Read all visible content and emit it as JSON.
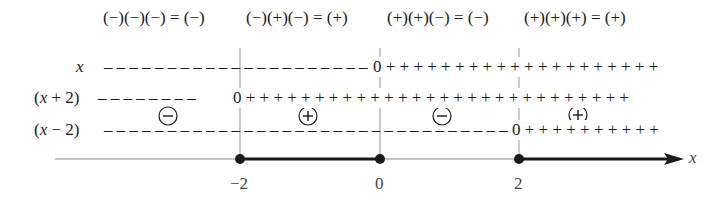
{
  "interval_headers": [
    {
      "text": "(−)(−)(−) = (−)",
      "x": 103
    },
    {
      "text": "(−)(+)(−) = (+)",
      "x": 246
    },
    {
      "text": "(+)(+)(−) = (−)",
      "x": 387
    },
    {
      "text": "(+)(+)(+) = (+)",
      "x": 524
    }
  ],
  "factor_rows": [
    {
      "label": "x",
      "label_x": 76,
      "y": 68,
      "zero_at": 0
    },
    {
      "label": "(x + 2)",
      "label_x": 34,
      "y": 99,
      "zero_at": -2
    },
    {
      "label": "(x − 2)",
      "label_x": 34,
      "y": 131,
      "zero_at": 2
    }
  ],
  "circled_signs": [
    {
      "sign": "−",
      "cx": 168,
      "cy": 116
    },
    {
      "sign": "+",
      "cx": 308,
      "cy": 116
    },
    {
      "sign": "−",
      "cx": 442,
      "cy": 116
    },
    {
      "sign": "+",
      "cx": 578,
      "cy": 115
    }
  ],
  "number_line": {
    "axis_label": "x",
    "ticks": [
      {
        "label": "−2",
        "value": -2,
        "px": 240
      },
      {
        "label": "0",
        "value": 0,
        "px": 380
      },
      {
        "label": "2",
        "value": 2,
        "px": 519
      }
    ],
    "solution_intervals": [
      "[−2, 0]",
      "[2, ∞)"
    ]
  },
  "colors": {
    "ink": "#1a1a1a",
    "guide": "#b5b5b5",
    "axis": "#8a8a8a"
  }
}
